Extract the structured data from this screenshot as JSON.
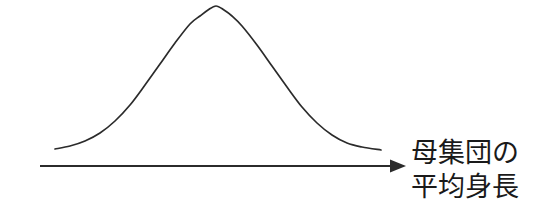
{
  "figure": {
    "kind": "normal-distribution-diagram",
    "background_color": "#ffffff",
    "stroke_color": "#2b2b2b",
    "text_color": "#1a1a1a"
  },
  "axis": {
    "name": "horizontal-axis-arrow",
    "start_x": 40,
    "end_x": 406,
    "y": 166,
    "arrowhead": "right",
    "label_lines": [
      "母集団の",
      "平均身長"
    ],
    "label_full": "母集団の平均身長"
  },
  "chart_data": {
    "type": "line",
    "title": "",
    "subtitle": "",
    "xlabel": "母集団の平均身長",
    "ylabel": "",
    "grid": false,
    "legend": null,
    "annotations": [],
    "xlim": [
      40,
      406
    ],
    "ylim": [
      0,
      1
    ],
    "curve": {
      "name": "normal-distribution-curve",
      "distribution": "normal",
      "mean_x": 216,
      "peak_y": 6,
      "baseline_y": 150,
      "left_tail_x": 55,
      "right_tail_x": 381,
      "sigma_px": 58,
      "x": [
        55,
        70,
        85,
        100,
        115,
        130,
        145,
        160,
        175,
        190,
        200,
        208,
        216,
        224,
        232,
        242,
        257,
        272,
        287,
        302,
        317,
        332,
        347,
        362,
        381
      ],
      "y": [
        149,
        146,
        141,
        133,
        121,
        105,
        85,
        64,
        43,
        24,
        16,
        10,
        6,
        10,
        16,
        26,
        45,
        66,
        87,
        107,
        123,
        135,
        143,
        147,
        150
      ]
    }
  }
}
